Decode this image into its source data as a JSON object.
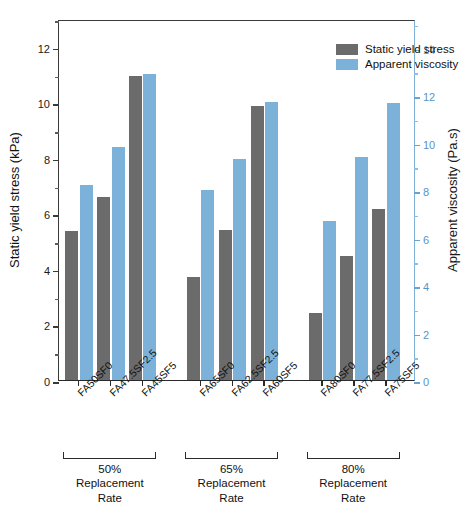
{
  "chart_data": {
    "type": "bar",
    "title": "",
    "xlabel": "",
    "ylabel": "Static yield stress (kPa)",
    "y2label": "Apparent viscosity (Pa.s)",
    "ylim": [
      0,
      13
    ],
    "y2lim": [
      0,
      15.2
    ],
    "yticks": [
      0,
      2,
      4,
      6,
      8,
      10,
      12
    ],
    "y2ticks": [
      0,
      2,
      4,
      6,
      8,
      10,
      12,
      14
    ],
    "grid": false,
    "legend_position": "top-right",
    "categories": [
      "FA50SF0",
      "FA47.5SF2.5",
      "FA45SF5",
      "FA65SF0",
      "FA62.5SF2.5",
      "FA60SF5",
      "FA80SF0",
      "FA77.5SF2.5",
      "FA75SF5"
    ],
    "series": [
      {
        "name": "Static yield stress",
        "axis": "left",
        "unit": "kPa",
        "color": "#6b6b6b",
        "values": [
          5.35,
          6.6,
          10.95,
          3.7,
          5.4,
          9.85,
          2.4,
          4.45,
          6.15
        ]
      },
      {
        "name": "Apparent viscosity",
        "axis": "right",
        "unit": "Pa.s",
        "color": "#7cb2da",
        "values": [
          8.2,
          9.8,
          12.9,
          8.0,
          9.3,
          11.7,
          6.7,
          9.4,
          11.65
        ]
      }
    ],
    "groups": [
      {
        "id": "g1",
        "percent": "50%",
        "caption_line2": "Replacement Rate",
        "categories": [
          "FA50SF0",
          "FA47.5SF2.5",
          "FA45SF5"
        ]
      },
      {
        "id": "g2",
        "percent": "65%",
        "caption_line2": "Replacement Rate",
        "categories": [
          "FA65SF0",
          "FA62.5SF2.5",
          "FA60SF5"
        ]
      },
      {
        "id": "g3",
        "percent": "80%",
        "caption_line2": "Replacement Rate",
        "categories": [
          "FA80SF0",
          "FA77.5SF2.5",
          "FA75SF5"
        ]
      }
    ]
  },
  "legend": {
    "items": [
      {
        "label": "Static yield stress",
        "color": "#6b6b6b"
      },
      {
        "label": "Apparent viscosity",
        "color": "#7cb2da"
      }
    ]
  },
  "axes": {
    "left": {
      "title": "Static yield stress (kPa)",
      "labels": [
        "0",
        "2",
        "4",
        "6",
        "8",
        "10",
        "12"
      ]
    },
    "right": {
      "title": "Apparent viscosity (Pa.s)",
      "labels": [
        "0",
        "2",
        "4",
        "6",
        "8",
        "10",
        "12",
        "14"
      ],
      "color": "#5b93c4"
    }
  },
  "groups_captions": [
    {
      "percent": "50%",
      "line2": "Replacement Rate"
    },
    {
      "percent": "65%",
      "line2": "Replacement Rate"
    },
    {
      "percent": "80%",
      "line2": "Replacement Rate"
    }
  ]
}
